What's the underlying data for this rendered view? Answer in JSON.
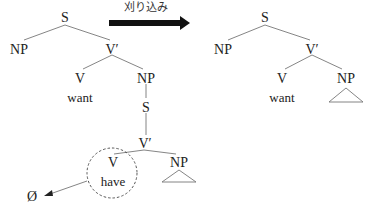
{
  "transform": {
    "label": "刈り込み",
    "arrow_color": "#111111"
  },
  "tree_before": {
    "root": "S",
    "subject": "NP",
    "vbar": "V′",
    "verb": "V",
    "verb_word": "want",
    "object": "NP",
    "embedded_s": "S",
    "embedded_vbar": "V′",
    "embedded_verb": "V",
    "embedded_verb_word": "have",
    "embedded_object": "NP",
    "deleted_marker": "Ø"
  },
  "tree_after": {
    "root": "S",
    "subject": "NP",
    "vbar": "V′",
    "verb": "V",
    "verb_word": "want",
    "object": "NP"
  }
}
